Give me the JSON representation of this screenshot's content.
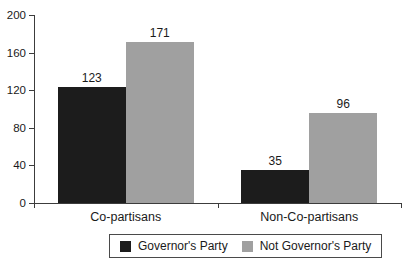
{
  "chart_data": {
    "type": "bar",
    "categories": [
      "Co-partisans",
      "Non-Co-partisans"
    ],
    "series": [
      {
        "name": "Governor's Party",
        "color": "#1c1c1c",
        "values": [
          123,
          35
        ]
      },
      {
        "name": "Not Governor's Party",
        "color": "#a0a0a0",
        "values": [
          171,
          96
        ]
      }
    ],
    "title": "",
    "xlabel": "",
    "ylabel": "",
    "ylim": [
      0,
      200
    ],
    "yticks": [
      0,
      40,
      80,
      120,
      160,
      200
    ],
    "grid": false,
    "legend_position": "bottom",
    "bar_value_labels": [
      123,
      171,
      35,
      96
    ]
  },
  "colors": {
    "background": "#ffffff",
    "axis": "#3c3c3c",
    "text": "#1a1a1a",
    "legend_border": "#4a4a4a",
    "bar_black": "#1c1c1c",
    "bar_gray": "#a0a0a0"
  }
}
